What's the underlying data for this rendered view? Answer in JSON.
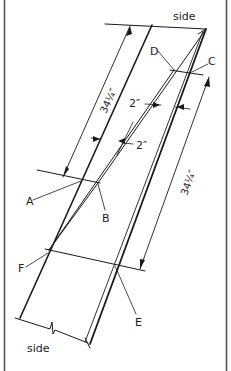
{
  "diagram": {
    "type": "technical-drawing",
    "labels": {
      "side_top": "side",
      "side_bottom": "side",
      "point_a": "A",
      "point_b": "B",
      "point_c": "C",
      "point_d": "D",
      "point_e": "E",
      "point_f": "F"
    },
    "dimensions": {
      "left_length": "34¼″",
      "right_length": "34¼″",
      "offset_upper": "2″",
      "offset_lower": "2″"
    },
    "colors": {
      "line": "#1a1a1a",
      "frame": "#444444",
      "background": "#ffffff"
    }
  }
}
